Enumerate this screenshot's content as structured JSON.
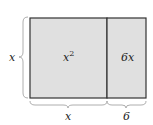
{
  "diagram": {
    "type": "area-model",
    "regions": [
      {
        "id": "left",
        "label": "x",
        "exponent": "2",
        "fill": "#e0e0e0"
      },
      {
        "id": "right",
        "label": "6x",
        "fill": "#e0e0e0"
      }
    ],
    "side_label": "x",
    "bottom_labels": [
      "x",
      "6"
    ],
    "stroke_color": "#333333"
  }
}
